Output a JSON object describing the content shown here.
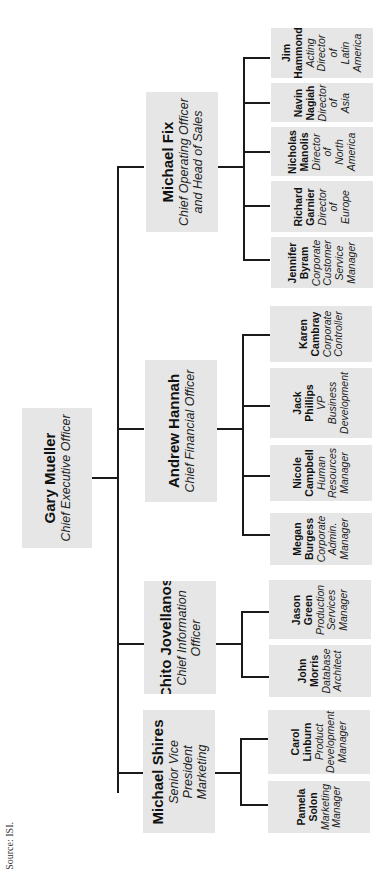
{
  "source": "Source: ISI.",
  "ceo": {
    "name": "Gary Mueller",
    "title": "Chief Executive Officer"
  },
  "executives": [
    {
      "name": "Michael Fix",
      "title": "Chief Operating Officer and Head of Sales",
      "title_lines": [
        "Chief Operating Officer",
        "and Head of Sales"
      ],
      "reports": [
        {
          "name_lines": [
            "Jim",
            "Hammond"
          ],
          "title_lines": [
            "Acting",
            "Director",
            "of",
            "Latin",
            "America"
          ]
        },
        {
          "name_lines": [
            "Navin",
            "Nagiah"
          ],
          "title_lines": [
            "Director",
            "of",
            "Asia"
          ]
        },
        {
          "name_lines": [
            "Nicholas",
            "Manolis"
          ],
          "title_lines": [
            "Director",
            "of",
            "North",
            "America"
          ]
        },
        {
          "name_lines": [
            "Richard",
            "Garnier"
          ],
          "title_lines": [
            "Director",
            "of",
            "Europe"
          ]
        },
        {
          "name_lines": [
            "Jennifer",
            "Byram"
          ],
          "title_lines": [
            "Corporate",
            "Customer",
            "Service",
            "Manager"
          ]
        }
      ]
    },
    {
      "name": "Andrew Hannah",
      "title": "Chief Financial Officer",
      "title_lines": [
        "Chief Financial Officer"
      ],
      "reports": [
        {
          "name_lines": [
            "Karen",
            "Cambray"
          ],
          "title_lines": [
            "Corporate",
            "Controller"
          ]
        },
        {
          "name_lines": [
            "Jack",
            "Phillips"
          ],
          "title_lines": [
            "VP",
            "Business",
            "Development"
          ]
        },
        {
          "name_lines": [
            "Nicole",
            "Campbell"
          ],
          "title_lines": [
            "Human",
            "Resources",
            "Manager"
          ]
        },
        {
          "name_lines": [
            "Megan",
            "Burgess"
          ],
          "title_lines": [
            "Corporate",
            "Admin.",
            "Manager"
          ]
        }
      ]
    },
    {
      "name": "Chito Jovellanos",
      "title": "Chief Information Officer",
      "title_lines": [
        "Chief Information",
        "Officer"
      ],
      "reports": [
        {
          "name_lines": [
            "Jason",
            "Green"
          ],
          "title_lines": [
            "Production",
            "Services",
            "Manager"
          ]
        },
        {
          "name_lines": [
            "John",
            "Morris"
          ],
          "title_lines": [
            "Database",
            "Architect"
          ]
        }
      ]
    },
    {
      "name": "Michael Shires",
      "title": "Senior Vice President Marketing",
      "title_lines": [
        "Senior Vice",
        "President",
        "Marketing"
      ],
      "reports": [
        {
          "name_lines": [
            "Carol",
            "Linburn"
          ],
          "title_lines": [
            "Product",
            "Development",
            "Manager"
          ]
        },
        {
          "name_lines": [
            "Pamela",
            "Solon"
          ],
          "title_lines": [
            "Marketing",
            "Manager"
          ]
        }
      ]
    }
  ],
  "colors": {
    "box_fill": "#e6e6e6",
    "line": "#1a1a1a",
    "background": "#ffffff"
  }
}
